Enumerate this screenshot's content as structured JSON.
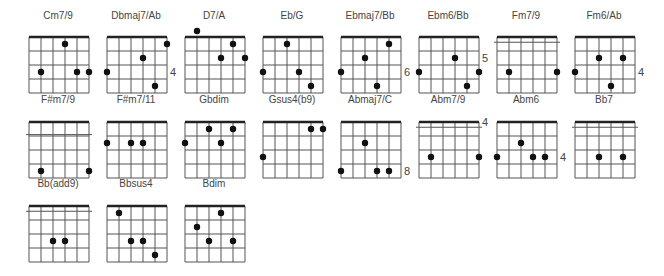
{
  "diagram": {
    "type": "guitar-chord-chart",
    "strings": 6,
    "frets_shown": 4,
    "colors": {
      "grid": "#555555",
      "nut": "#222222",
      "dot": "#111111",
      "label": "#444444"
    },
    "chords": [
      {
        "name": "Cm7/9",
        "fret_label": "",
        "barre": null,
        "dots": [
          [
            3,
            1
          ],
          [
            1,
            3
          ],
          [
            4,
            3
          ],
          [
            5,
            3
          ]
        ]
      },
      {
        "name": "Dbmaj7/Ab",
        "fret_label": "4",
        "fret_label_fret": 3,
        "barre": null,
        "dots": [
          [
            5,
            1
          ],
          [
            3,
            2
          ],
          [
            0,
            3
          ],
          [
            4,
            4
          ]
        ]
      },
      {
        "name": "D7/A",
        "fret_label": "",
        "barre": null,
        "dots": [
          [
            1,
            0
          ],
          [
            4,
            1
          ],
          [
            3,
            2
          ],
          [
            5,
            2
          ]
        ]
      },
      {
        "name": "Eb/G",
        "fret_label": "",
        "barre": null,
        "dots": [
          [
            2,
            1
          ],
          [
            0,
            3
          ],
          [
            3,
            3
          ],
          [
            4,
            4
          ]
        ]
      },
      {
        "name": "Ebmaj7/Bb",
        "fret_label": "6",
        "fret_label_fret": 3,
        "barre": null,
        "dots": [
          [
            4,
            1
          ],
          [
            2,
            2
          ],
          [
            0,
            3
          ],
          [
            3,
            4
          ]
        ]
      },
      {
        "name": "Ebm6/Bb",
        "fret_label": "5",
        "fret_label_fret": 2,
        "barre": null,
        "dots": [
          [
            3,
            2
          ],
          [
            0,
            3
          ],
          [
            5,
            3
          ],
          [
            4,
            4
          ]
        ]
      },
      {
        "name": "Fm7/9",
        "fret_label": "",
        "barre": 0.5,
        "dots": [
          [
            1,
            3
          ],
          [
            5,
            3
          ]
        ]
      },
      {
        "name": "Fm6/Ab",
        "fret_label": "4",
        "fret_label_fret": 3,
        "barre": null,
        "dots": [
          [
            2,
            2
          ],
          [
            4,
            2
          ],
          [
            0,
            3
          ],
          [
            3,
            4
          ]
        ]
      },
      {
        "name": "F#m7/9",
        "fret_label": "",
        "barre": 1.5,
        "dots": [
          [
            1,
            4
          ],
          [
            5,
            4
          ]
        ]
      },
      {
        "name": "F#m7/11",
        "fret_label": "",
        "barre": null,
        "dots": [
          [
            0,
            2
          ],
          [
            2,
            2
          ],
          [
            3,
            2
          ]
        ]
      },
      {
        "name": "Gbdim",
        "fret_label": "",
        "barre": null,
        "dots": [
          [
            2,
            1
          ],
          [
            4,
            1
          ],
          [
            0,
            2
          ],
          [
            3,
            2
          ]
        ]
      },
      {
        "name": "Gsus4(b9)",
        "fret_label": "",
        "barre": null,
        "dots": [
          [
            4,
            1
          ],
          [
            5,
            1
          ],
          [
            0,
            3
          ]
        ]
      },
      {
        "name": "Abmaj7/C",
        "fret_label": "8",
        "fret_label_fret": 4,
        "barre": null,
        "dots": [
          [
            2,
            2
          ],
          [
            0,
            4
          ],
          [
            3,
            4
          ],
          [
            4,
            4
          ]
        ]
      },
      {
        "name": "Abm7/9",
        "fret_label": "4",
        "fret_label_fret": 0.5,
        "barre": 0.5,
        "dots": [
          [
            1,
            3
          ],
          [
            5,
            3
          ]
        ]
      },
      {
        "name": "Abm6",
        "fret_label": "4",
        "fret_label_fret": 3,
        "barre": null,
        "dots": [
          [
            2,
            2
          ],
          [
            0,
            3
          ],
          [
            3,
            3
          ],
          [
            4,
            3
          ]
        ]
      },
      {
        "name": "Bb7",
        "fret_label": "",
        "barre": 0.5,
        "dots": [
          [
            2,
            3
          ],
          [
            4,
            3
          ]
        ]
      },
      {
        "name": "Bb(add9)",
        "fret_label": "",
        "barre": 0.5,
        "dots": [
          [
            2,
            3
          ],
          [
            3,
            3
          ]
        ]
      },
      {
        "name": "Bbsus4",
        "fret_label": "",
        "barre": null,
        "dots": [
          [
            1,
            1
          ],
          [
            2,
            3
          ],
          [
            3,
            3
          ],
          [
            4,
            4
          ]
        ]
      },
      {
        "name": "Bdim",
        "fret_label": "",
        "barre": null,
        "dots": [
          [
            3,
            1
          ],
          [
            1,
            2
          ],
          [
            2,
            3
          ],
          [
            4,
            3
          ]
        ]
      }
    ]
  }
}
